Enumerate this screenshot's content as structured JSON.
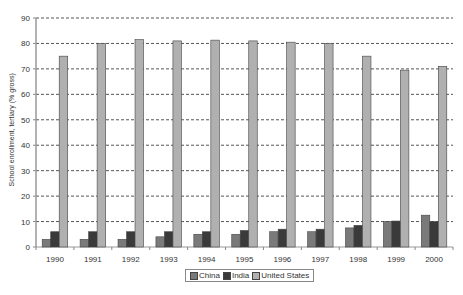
{
  "chart_data": {
    "type": "bar",
    "title": "",
    "xlabel": "",
    "ylabel": "School enrollment, tertiary (% gross)",
    "ylim": [
      0,
      90
    ],
    "yticks": [
      0,
      10,
      20,
      30,
      40,
      50,
      60,
      70,
      80,
      90
    ],
    "grid": true,
    "legend_position": "bottom",
    "categories": [
      "1990",
      "1991",
      "1992",
      "1993",
      "1994",
      "1995",
      "1996",
      "1997",
      "1998",
      "1999",
      "2000"
    ],
    "series": [
      {
        "name": "China",
        "color": "#7a7a7a",
        "values": [
          3,
          3,
          3,
          4,
          5,
          5,
          6,
          6,
          7.5,
          10,
          12.5
        ]
      },
      {
        "name": "India",
        "color": "#3a3a3a",
        "values": [
          6,
          6,
          6,
          6,
          6,
          6.5,
          7,
          7,
          8.5,
          10.2,
          10
        ]
      },
      {
        "name": "United States",
        "color": "#b0b0b0",
        "values": [
          75,
          80,
          81.5,
          81,
          81.3,
          81,
          80.5,
          80,
          75,
          69.5,
          71
        ]
      }
    ]
  },
  "legend": {
    "items": [
      "China",
      "India",
      "United States"
    ]
  }
}
